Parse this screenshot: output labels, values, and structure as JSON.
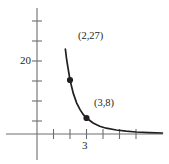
{
  "chart_data": {
    "type": "line",
    "title": "",
    "subtitle": "",
    "xlabel": "",
    "ylabel": "",
    "grid": false,
    "legend": "none",
    "axis_style": "cartesian-axes-with-ticks",
    "xlim": [
      -1,
      8.25
    ],
    "ylim": [
      -8,
      38
    ],
    "x_ticks": [
      1,
      2,
      3,
      4,
      5,
      6
    ],
    "x_tick_labels": [
      "",
      "",
      "3",
      "",
      "",
      ""
    ],
    "y_ticks": [
      10,
      20,
      30,
      35
    ],
    "y_tick_labels": [
      "",
      "20",
      "",
      ""
    ],
    "curve_equation": "y = 216 / x^3",
    "curve_description": "decreasing convex curve approaching the x-axis asymptotically",
    "curve_points": [
      {
        "x": 1.72,
        "y": 42.4
      },
      {
        "x": 1.8,
        "y": 37.0
      },
      {
        "x": 2.0,
        "y": 27.0
      },
      {
        "x": 2.2,
        "y": 20.3
      },
      {
        "x": 2.4,
        "y": 15.6
      },
      {
        "x": 2.6,
        "y": 12.3
      },
      {
        "x": 2.8,
        "y": 9.8
      },
      {
        "x": 3.0,
        "y": 8.0
      },
      {
        "x": 3.4,
        "y": 5.5
      },
      {
        "x": 3.8,
        "y": 3.9
      },
      {
        "x": 4.2,
        "y": 2.9
      },
      {
        "x": 4.8,
        "y": 2.0
      },
      {
        "x": 5.4,
        "y": 1.4
      },
      {
        "x": 6.0,
        "y": 1.0
      },
      {
        "x": 6.8,
        "y": 0.7
      },
      {
        "x": 7.6,
        "y": 0.5
      }
    ],
    "marked_points": [
      {
        "x": 2,
        "y": 27,
        "label": "(2,27)"
      },
      {
        "x": 3,
        "y": 8,
        "label": "(3,8)"
      }
    ],
    "colors": {
      "curve": "#231f20",
      "axis": "#6d6e71",
      "marker": "#231f20",
      "text": "#231f20",
      "background": "#ffffff"
    }
  },
  "labels": {
    "y_tick_20": "20",
    "x_tick_3": "3",
    "point_1": "(2,27)",
    "point_2": "(3,8)"
  }
}
